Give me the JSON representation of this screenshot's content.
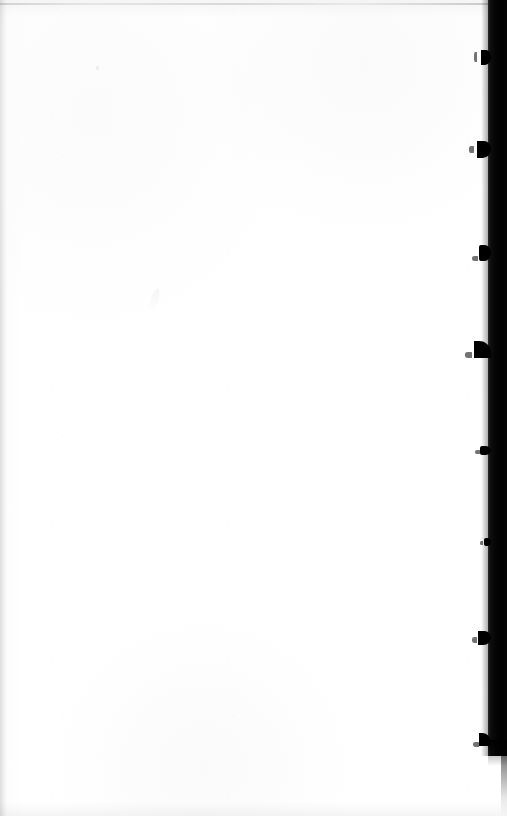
{
  "document": {
    "kind": "scanned-book-page",
    "page_state": "blank",
    "visible_text": "",
    "orientation": "portrait",
    "width_px": 507,
    "height_px": 816
  },
  "colors": {
    "paper": "#ffffff",
    "paper_shade": "#f2f2f2",
    "gutter_dark": "#000000",
    "gutter_edge": "#2a2a2a",
    "top_rule": "#bcbcbc",
    "speckle": "rgba(0,0,0,0.05)"
  },
  "features": {
    "top_edge_rule_label": "scan top edge line",
    "left_edge_label": "sheet left edge shading",
    "bottom_edge_label": "sheet bottom edge shading",
    "gutter_label": "binding gutter shadow",
    "smudge_label": "scan smudge",
    "speck_label": "paper speck"
  },
  "binding": {
    "band": {
      "right_px": 0,
      "top_px": 0,
      "width_px": 19,
      "height_px": 756
    },
    "marks": [
      {
        "name": "staple-mark-1",
        "top": 50,
        "left_offset": 13,
        "w": 10,
        "h": 15,
        "style": "mark-hook",
        "tick_top": 52,
        "tick_left": 11,
        "tick_w": 3,
        "tick_h": 10
      },
      {
        "name": "staple-mark-2",
        "top": 141,
        "left_offset": 18,
        "w": 14,
        "h": 17,
        "style": "mark-hook",
        "tick_top": 146,
        "tick_left": 14,
        "tick_w": 5,
        "tick_h": 7
      },
      {
        "name": "staple-mark-3",
        "top": 245,
        "left_offset": 14,
        "w": 12,
        "h": 16,
        "style": "mark-nub",
        "tick_top": 256,
        "tick_left": 10,
        "tick_w": 6,
        "tick_h": 5
      },
      {
        "name": "staple-mark-4",
        "top": 341,
        "left_offset": 21,
        "w": 17,
        "h": 17,
        "style": "mark-point",
        "tick_top": 352,
        "tick_left": 16,
        "tick_w": 7,
        "tick_h": 6
      },
      {
        "name": "staple-mark-5",
        "top": 446,
        "left_offset": 11,
        "w": 11,
        "h": 9,
        "style": "mark-nub",
        "tick_top": 450,
        "tick_left": 8,
        "tick_w": 5,
        "tick_h": 4
      },
      {
        "name": "staple-mark-6",
        "top": 538,
        "left_offset": 7,
        "w": 7,
        "h": 8,
        "style": "mark-nub",
        "tick_top": 541,
        "tick_left": 5,
        "tick_w": 3,
        "tick_h": 4
      },
      {
        "name": "staple-mark-7",
        "top": 631,
        "left_offset": 15,
        "w": 13,
        "h": 14,
        "style": "mark-hook",
        "tick_top": 637,
        "tick_left": 11,
        "tick_w": 5,
        "tick_h": 6
      },
      {
        "name": "staple-mark-8",
        "top": 733,
        "left_offset": 13,
        "w": 12,
        "h": 13,
        "style": "mark-point",
        "tick_top": 742,
        "tick_left": 9,
        "tick_w": 6,
        "tick_h": 5
      }
    ]
  }
}
